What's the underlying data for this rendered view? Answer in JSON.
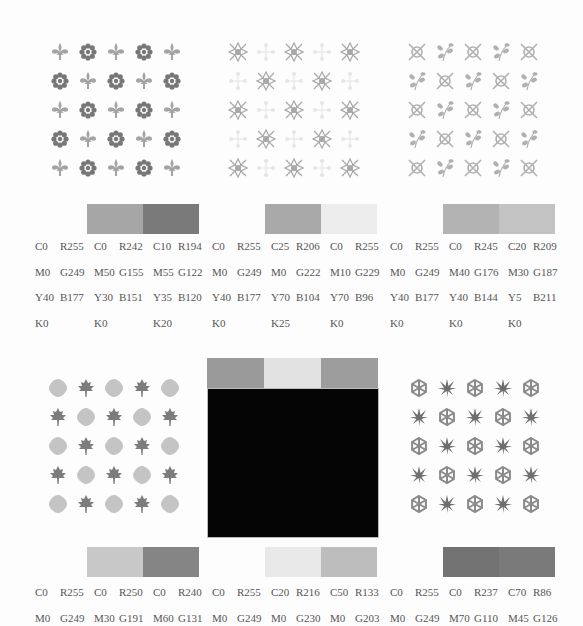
{
  "page": {
    "background": "#fdfdfd"
  },
  "palettes": [
    {
      "id": "fleur-flower",
      "motifs": [
        "fleur-de-lis",
        "flower-rosette"
      ],
      "motif_colors": [
        "#a3a3a3",
        "#777777"
      ],
      "swatches": [
        "#a6a6a6",
        "#7a7a7a"
      ],
      "colors": [
        {
          "c": "C0",
          "m": "M0",
          "y": "Y40",
          "k": "K0",
          "r": "R255",
          "g": "G249",
          "b": "B177"
        },
        {
          "c": "C0",
          "m": "M50",
          "y": "Y30",
          "k": "K0",
          "r": "R242",
          "g": "G155",
          "b": "B151"
        },
        {
          "c": "C10",
          "m": "M55",
          "y": "Y35",
          "k": "K20",
          "r": "R194",
          "g": "G122",
          "b": "B120"
        }
      ]
    },
    {
      "id": "ornate-cross",
      "motifs": [
        "ornate-tile",
        "dotted-cross"
      ],
      "motif_colors": [
        "#a8a8a8",
        "#e6e6e6"
      ],
      "swatches": [
        "#a9a9a9",
        "#ededed"
      ],
      "colors": [
        {
          "c": "C0",
          "m": "M0",
          "y": "Y40",
          "k": "K0",
          "r": "R255",
          "g": "G249",
          "b": "B177"
        },
        {
          "c": "C25",
          "m": "M0",
          "y": "Y70",
          "k": "K25",
          "r": "R206",
          "g": "G222",
          "b": "B104"
        },
        {
          "c": "C0",
          "m": "M10",
          "y": "Y70",
          "k": "K0",
          "r": "R255",
          "g": "G229",
          "b": "B96"
        }
      ]
    },
    {
      "id": "crossed-sprig",
      "motifs": [
        "crossed-circle",
        "leaf-sprig"
      ],
      "motif_colors": [
        "#b0b0b0",
        "#b0b0b0"
      ],
      "swatches": [
        "#b3b3b3",
        "#c3c3c3"
      ],
      "colors": [
        {
          "c": "C0",
          "m": "M0",
          "y": "Y40",
          "k": "K0",
          "r": "R255",
          "g": "G249",
          "b": "B177"
        },
        {
          "c": "C0",
          "m": "M40",
          "y": "Y40",
          "k": "K0",
          "r": "R245",
          "g": "G176",
          "b": "B144"
        },
        {
          "c": "C20",
          "m": "M30",
          "y": "Y5",
          "k": "K0",
          "r": "R209",
          "g": "G187",
          "b": "B211"
        }
      ]
    },
    {
      "id": "maple-blossom",
      "motifs": [
        "round-blossom",
        "maple-leaf"
      ],
      "motif_colors": [
        "#c4c4c4",
        "#7c7c7c"
      ],
      "swatches": [
        "#c8c8c8",
        "#858585"
      ],
      "colors": [
        {
          "c": "C0",
          "m": "M0",
          "r": "R255",
          "g": "G249"
        },
        {
          "c": "C0",
          "m": "M30",
          "r": "R250",
          "g": "G191"
        },
        {
          "c": "C0",
          "m": "M60",
          "r": "R240",
          "g": "G131"
        }
      ]
    },
    {
      "id": "black-block",
      "motifs": [],
      "top_swatches": [
        "#9a9a9a",
        "#e2e2e2",
        "#9d9d9d"
      ],
      "block_color": "#050505",
      "swatches": [
        "#e9e9e9",
        "#bdbdbd"
      ],
      "colors": [
        {
          "c": "C0",
          "m": "M0",
          "r": "R255",
          "g": "G249"
        },
        {
          "c": "C20",
          "m": "M0",
          "r": "R216",
          "g": "G230"
        },
        {
          "c": "C50",
          "m": "M0",
          "r": "R133",
          "g": "G203"
        }
      ]
    },
    {
      "id": "snowflake-leaf",
      "motifs": [
        "snowflake",
        "japanese-maple"
      ],
      "motif_colors": [
        "#8a8a8a",
        "#6e6e6e"
      ],
      "swatches": [
        "#727272",
        "#7a7a7a"
      ],
      "colors": [
        {
          "c": "C0",
          "m": "M0",
          "r": "R255",
          "g": "G249"
        },
        {
          "c": "C0",
          "m": "M70",
          "r": "R237",
          "g": "G110"
        },
        {
          "c": "C70",
          "m": "M45",
          "r": "R86",
          "g": "G126"
        }
      ]
    }
  ]
}
